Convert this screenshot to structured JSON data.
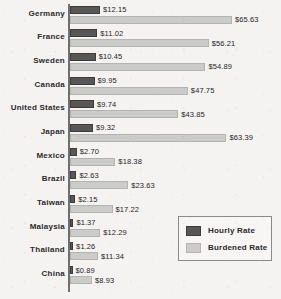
{
  "chart_data": {
    "type": "bar",
    "orientation": "horizontal",
    "title": "",
    "subtitle": "",
    "xlabel": "",
    "ylabel": "",
    "grid": false,
    "legend_position": "bottom-right",
    "xlim": [
      0,
      65.63
    ],
    "categories": [
      "Germany",
      "France",
      "Sweden",
      "Canada",
      "United States",
      "Japan",
      "Mexico",
      "Brazil",
      "Taiwan",
      "Malaysia",
      "Thailand",
      "China"
    ],
    "series": [
      {
        "name": "Hourly Rate",
        "color": "#575757",
        "values": [
          12.15,
          11.02,
          10.45,
          9.95,
          9.74,
          9.32,
          2.7,
          2.63,
          2.15,
          1.37,
          1.26,
          0.89
        ],
        "labels": [
          "$12.15",
          "$11.02",
          "$10.45",
          "$9.95",
          "$9.74",
          "$9.32",
          "$2.70",
          "$2.63",
          "$2.15",
          "$1.37",
          "$1.26",
          "$0.89"
        ]
      },
      {
        "name": "Burdened Rate",
        "color": "#cbcbc9",
        "values": [
          65.63,
          56.21,
          54.89,
          47.75,
          43.85,
          63.39,
          18.38,
          23.63,
          17.22,
          12.29,
          11.34,
          8.93
        ],
        "labels": [
          "$65.63",
          "$56.21",
          "$54.89",
          "$47.75",
          "$43.85",
          "$63.39",
          "$18.38",
          "$23.63",
          "$17.22",
          "$12.29",
          "$11.34",
          "$8.93"
        ]
      }
    ]
  },
  "legend": {
    "entries": [
      {
        "label": "Hourly Rate",
        "color": "#575757"
      },
      {
        "label": "Burdened Rate",
        "color": "#cbcbc9"
      }
    ]
  },
  "colors": {
    "background": "#f4f3f1",
    "axis": "#707070",
    "hourly": "#575757",
    "burdened": "#cbcbc9",
    "text": "#1f1f1f"
  }
}
